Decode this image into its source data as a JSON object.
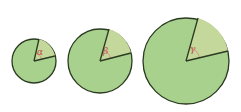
{
  "diagram": {
    "colors": {
      "fill": "#a8d18d",
      "stroke": "#2b3a22",
      "sector_fill": "#c3d89a",
      "arc": "#d98c7a",
      "label": "#c0504d"
    },
    "circles": [
      {
        "cx": 34,
        "cy": 61,
        "r": 22,
        "p1": [
          39,
          39
        ],
        "p2": [
          55,
          56
        ],
        "label": "α",
        "lx": 37,
        "ly": 55,
        "arc_r": 8
      },
      {
        "cx": 100,
        "cy": 61,
        "r": 32,
        "p1": [
          109,
          29
        ],
        "p2": [
          131,
          53
        ],
        "label": "β",
        "lx": 103,
        "ly": 54,
        "arc_r": 11
      },
      {
        "cx": 186,
        "cy": 61,
        "r": 43,
        "p1": [
          198,
          18
        ],
        "p2": [
          228,
          51
        ],
        "label": "γ",
        "lx": 190,
        "ly": 52,
        "arc_r": 14
      }
    ]
  }
}
